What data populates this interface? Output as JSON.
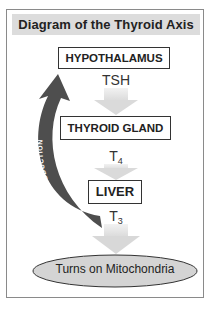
{
  "title": "Diagram of the Thyroid Axis",
  "nodes": {
    "hypothalamus": "HYPOTHALAMUS",
    "thyroid_gland": "THYROID GLAND",
    "liver": "LIVER",
    "mitochondria": "Turns on Mitochondria"
  },
  "hormones": {
    "tsh": "TSH",
    "t4_base": "T",
    "t4_sub": "4",
    "t3_base": "T",
    "t3_sub": "3"
  },
  "feedback_arrow": {
    "label": "TURNS DOWN PRODUCTION"
  },
  "colors": {
    "frame": "#8a8a8a",
    "title_band": "#dcdcdc",
    "flow_arrow": "#e0e0e0",
    "feedback_arrow": "#555555",
    "ellipse_fill": "#d4d4d4"
  }
}
